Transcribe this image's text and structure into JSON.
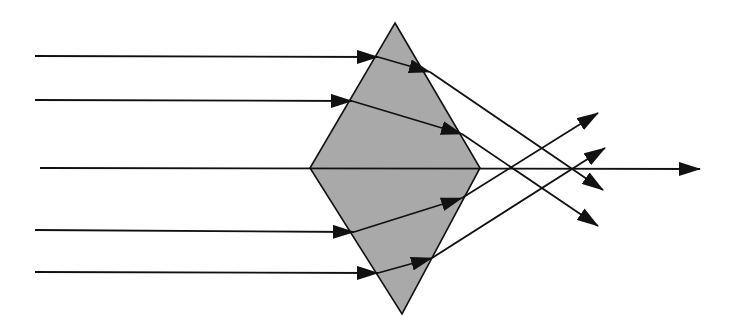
{
  "diagram": {
    "colors": {
      "background": "#ffffff",
      "prism_fill": "#a9a9a9",
      "stroke": "#111111"
    },
    "prism": {
      "shape": "rhombus",
      "vertices": {
        "top": [
          395,
          23
        ],
        "right": [
          480,
          168
        ],
        "bottom": [
          402,
          314
        ],
        "left": [
          310,
          168
        ]
      }
    },
    "rays": [
      {
        "id": "ray-1",
        "incoming": [
          [
            35,
            56
          ],
          [
            378,
            57
          ]
        ],
        "inside": [
          [
            378,
            57
          ],
          [
            430,
            72
          ]
        ],
        "outgoing": [
          [
            430,
            72
          ],
          [
            603,
            190
          ]
        ]
      },
      {
        "id": "ray-2",
        "incoming": [
          [
            35,
            100
          ],
          [
            352,
            101
          ]
        ],
        "inside": [
          [
            352,
            101
          ],
          [
            462,
            134
          ]
        ],
        "outgoing": [
          [
            462,
            134
          ],
          [
            598,
            226
          ]
        ]
      },
      {
        "id": "ray-3",
        "incoming": [
          [
            40,
            168
          ],
          [
            700,
            169
          ]
        ],
        "inside": null,
        "outgoing": null
      },
      {
        "id": "ray-4",
        "incoming": [
          [
            35,
            230
          ],
          [
            354,
            232
          ]
        ],
        "inside": [
          [
            354,
            232
          ],
          [
            462,
            198
          ]
        ],
        "outgoing": [
          [
            462,
            198
          ],
          [
            598,
            113
          ]
        ]
      },
      {
        "id": "ray-5",
        "incoming": [
          [
            35,
            272
          ],
          [
            378,
            273
          ]
        ],
        "inside": [
          [
            378,
            273
          ],
          [
            432,
            258
          ]
        ],
        "outgoing": [
          [
            432,
            258
          ],
          [
            605,
            148
          ]
        ]
      }
    ]
  }
}
